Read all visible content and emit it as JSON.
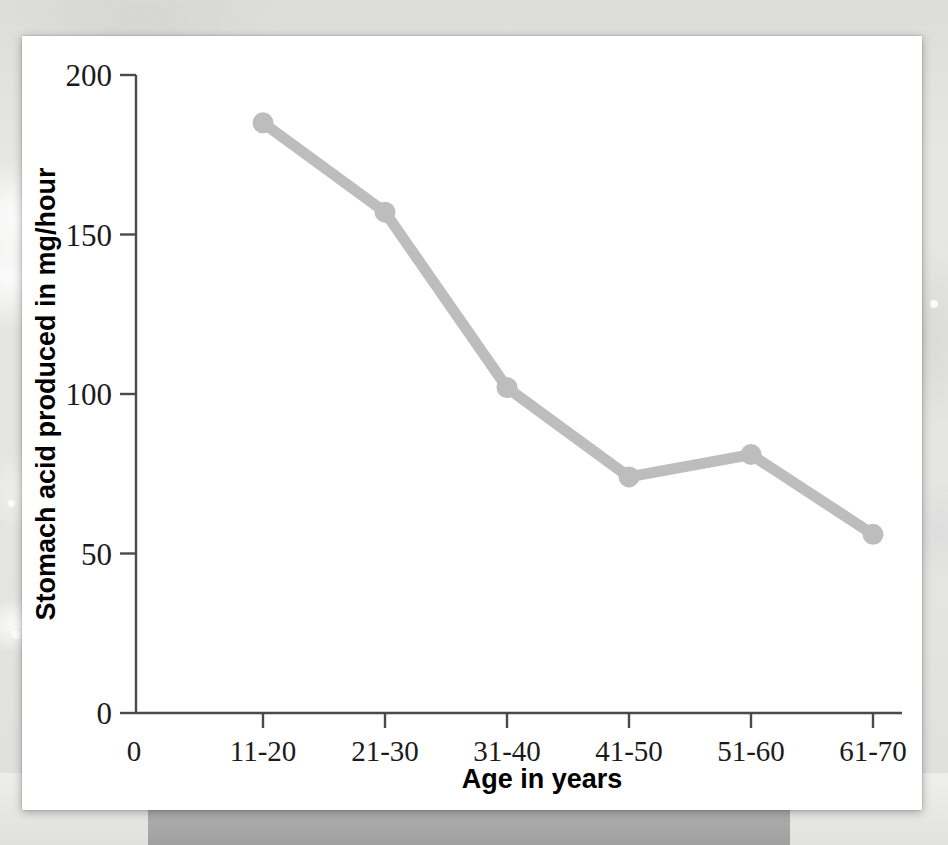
{
  "chart_data": {
    "type": "line",
    "title": "",
    "subtitle": "",
    "xlabel": "Age in years",
    "ylabel": "Stomach acid produced in mg/hour",
    "categories": [
      "11-20",
      "21-30",
      "31-40",
      "41-50",
      "51-60",
      "61-70"
    ],
    "values": [
      185,
      157,
      102,
      74,
      81,
      56
    ],
    "series": [
      {
        "name": "Stomach acid produced",
        "values": [
          185,
          157,
          102,
          74,
          81,
          56
        ]
      }
    ],
    "x_origin_label": "0",
    "xtick_labels": [
      "0",
      "11-20",
      "21-30",
      "31-40",
      "41-50",
      "51-60",
      "61-70"
    ],
    "ytick_labels": [
      "0",
      "50",
      "100",
      "150",
      "200"
    ],
    "ytick_values": [
      0,
      50,
      100,
      150,
      200
    ],
    "ylim": [
      0,
      200
    ],
    "grid": false,
    "legend": false,
    "legend_position": "none",
    "marker": "circle",
    "line_color": "#bdbdbd",
    "marker_color": "#bdbdbd",
    "axis_color": "#4a4a4a",
    "text_color": "#1b1b1b",
    "background_color": "#ffffff"
  },
  "card": {
    "background_color": "#ffffff"
  },
  "page": {
    "background_color": "#e3e3e1",
    "band_color": "#a8a8a8"
  }
}
